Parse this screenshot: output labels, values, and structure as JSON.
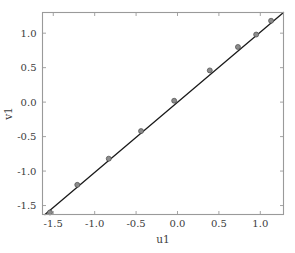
{
  "chart_data": {
    "type": "scatter",
    "title": "",
    "subtitle": "",
    "xlabel": "u1",
    "ylabel": "v1",
    "xlim": [
      -1.63,
      1.28
    ],
    "ylim": [
      -1.63,
      1.3
    ],
    "xticks": [
      -1.5,
      -1.0,
      -0.5,
      0.0,
      0.5,
      1.0
    ],
    "yticks": [
      -1.5,
      -1.0,
      -0.5,
      0.0,
      0.5,
      1.0
    ],
    "xticklabels": [
      "-1.5",
      "-1.0",
      "-0.5",
      "0.0",
      "0.5",
      "1.0"
    ],
    "yticklabels": [
      "-1.5",
      "-1.0",
      "-0.5",
      "0.0",
      "0.5",
      "1.0"
    ],
    "grid": false,
    "legend": null,
    "annotations": [],
    "series": [
      {
        "name": "reference-line",
        "type": "line",
        "color": "#1a1a1a",
        "linewidth": 1.3,
        "x": [
          -1.6,
          1.28
        ],
        "y": [
          -1.63,
          1.3
        ]
      },
      {
        "name": "data-points",
        "type": "scatter",
        "marker": "circle",
        "color": "#8c8c8c",
        "edgecolor": "#4a4a4a",
        "size": 5,
        "x": [
          -1.54,
          -1.21,
          -0.83,
          -0.44,
          -0.04,
          0.39,
          0.73,
          0.95,
          1.13
        ],
        "y": [
          -1.6,
          -1.2,
          -0.82,
          -0.42,
          0.02,
          0.46,
          0.8,
          0.98,
          1.18
        ]
      }
    ]
  },
  "axes": {
    "spine_color": "#9a9a9a",
    "tick_color": "#9a9a9a",
    "background": "#ffffff"
  },
  "figure": {
    "background": "#ffffff"
  }
}
